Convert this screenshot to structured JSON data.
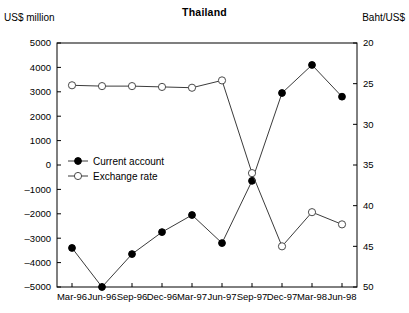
{
  "chart_data": {
    "type": "line",
    "title": "Thailand",
    "xlabel": "",
    "ylabel": "US$ million",
    "y2label": "Baht/US$",
    "categories": [
      "Mar-96",
      "Jun-96",
      "Sep-96",
      "Dec-96",
      "Mar-97",
      "Jun-97",
      "Sep-97",
      "Dec-97",
      "Mar-98",
      "Jun-98"
    ],
    "ylim": [
      -5000,
      5000
    ],
    "yticks": [
      "5000",
      "4000",
      "3000",
      "2000",
      "1000",
      "0",
      "-1000",
      "-2000",
      "-3000",
      "-4000",
      "-5000"
    ],
    "y2lim": [
      20,
      50
    ],
    "y2_inverted": true,
    "y2ticks": [
      "20",
      "25",
      "30",
      "35",
      "40",
      "45",
      "50"
    ],
    "grid": false,
    "legend_position": "upper-left-inside",
    "series": [
      {
        "name": "Current account",
        "axis": "left",
        "marker": "filled-circle",
        "values": [
          -3400,
          -5000,
          -3650,
          -2750,
          -2050,
          -3200,
          -650,
          2950,
          4100,
          2800
        ]
      },
      {
        "name": "Exchange rate",
        "axis": "right",
        "marker": "open-circle",
        "values": [
          25.2,
          25.3,
          25.3,
          25.4,
          25.5,
          24.6,
          36.0,
          45.0,
          40.8,
          42.3
        ]
      }
    ]
  },
  "legend": {
    "items": [
      {
        "label": "Current account"
      },
      {
        "label": "Exchange rate"
      }
    ]
  }
}
